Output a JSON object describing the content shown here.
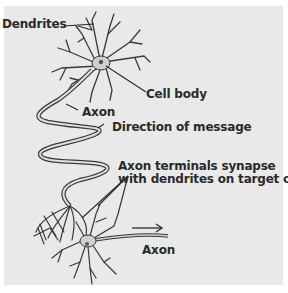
{
  "diagram": {
    "type": "neuron-anatomy",
    "labels": {
      "dendrites": "Dendrites",
      "cell_body": "Cell body",
      "axon_top": "Axon",
      "direction": "Direction of message",
      "terminals_line1": "Axon terminals synapse",
      "terminals_line2": "with dendrites on target cell",
      "axon_bottom": "Axon"
    },
    "colors": {
      "background": "#e9e9e9",
      "neuron_stroke": "#3a3a3a",
      "neuron_fill": "#cfcfcf",
      "text": "#2a2a2a"
    }
  }
}
